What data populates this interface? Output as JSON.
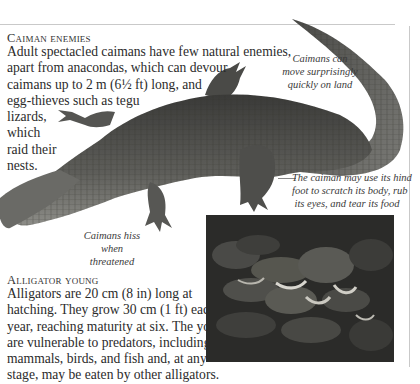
{
  "sections": {
    "caiman_enemies": {
      "heading": "Caiman enemies",
      "lines": [
        "Adult spectacled caimans have few natural enemies,",
        "apart from anacondas, which can devour",
        "caimans up to 2 m (6½ ft) long, and",
        "egg-thieves such as tegu",
        "lizards,",
        "which",
        "raid their",
        "nests."
      ]
    },
    "alligator_young": {
      "heading": "Alligator young",
      "lines": [
        "Alligators are 20 cm (8 in) long at",
        "hatching. They grow 30 cm (1 ft) each",
        "year, reaching maturity at six. The young",
        "are vulnerable to predators, including",
        "mammals, birds, and fish and, at any",
        "stage, may be eaten by other alligators."
      ]
    }
  },
  "captions": {
    "move_on_land": [
      "Caimans can",
      "move surprisingly",
      "quickly on land"
    ],
    "hind_foot": [
      "The caiman may use its hind",
      "foot to scratch its body, rub",
      "its eyes, and tear its food"
    ],
    "hiss": [
      "Caimans hiss",
      "when",
      "threatened"
    ]
  },
  "images": {
    "caiman": "caiman-illustration",
    "alligator_young_photo": "alligator-hatchlings-photo"
  },
  "colors": {
    "text": "#2b2b2b",
    "rule": "#c9c9c9",
    "caiman_dark": "#3e3e3c",
    "caiman_light": "#8a8a86"
  }
}
